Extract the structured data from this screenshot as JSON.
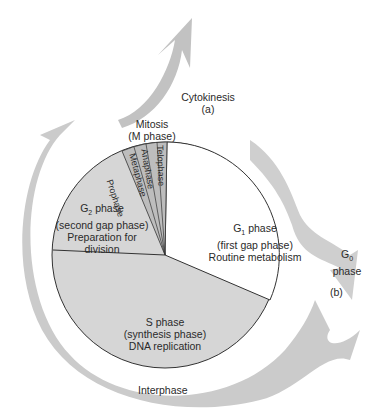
{
  "diagram": {
    "labels": {
      "cytokinesis": "Cytokinesis",
      "cytokinesis_marker": "(a)",
      "mitosis": "Mitosis",
      "mitosis_sub": "(M phase)",
      "g2_main": "G",
      "g2_sub": "2",
      "g2_word": " phase",
      "g2_desc1": "(second gap phase)",
      "g2_desc2": "Preparation for",
      "g2_desc3": "division",
      "g1_main": "G",
      "g1_sub": "1",
      "g1_word": " phase",
      "g1_desc1": "(first gap phase)",
      "g1_desc2": "Routine metabolism",
      "s_line1": "S phase",
      "s_line2": "(synthesis phase)",
      "s_line3": "DNA replication",
      "g0_main": "G",
      "g0_sub": "0",
      "g0_word": "phase",
      "g0_marker": "(b)",
      "interphase": "Interphase"
    },
    "mitosis_stages": [
      "Prophase",
      "Metaphase",
      "Anaphase",
      "Telophase"
    ],
    "colors": {
      "slice_fill": "#d4d4d4",
      "g1_fill": "#ffffff",
      "arrow_fill": "#c8c8c8",
      "outline": "#333333"
    }
  }
}
